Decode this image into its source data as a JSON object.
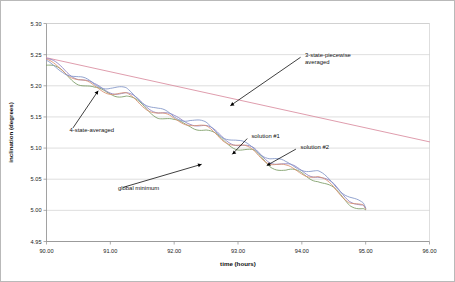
{
  "chart_data": {
    "type": "line",
    "title": "",
    "xlabel": "time (hours)",
    "ylabel": "inclination (degrees)",
    "xlim": [
      90.0,
      96.0
    ],
    "ylim": [
      4.95,
      5.3
    ],
    "xticks": [
      "90.00",
      "91.00",
      "92.00",
      "93.00",
      "94.00",
      "95.00",
      "96.00"
    ],
    "yticks": [
      "4.95",
      "5.00",
      "5.05",
      "5.10",
      "5.15",
      "5.20",
      "5.25",
      "5.30"
    ],
    "grid": "horizontal",
    "legend": "none (inline annotations)",
    "series": [
      {
        "name": "3-state-piecewise averaged",
        "color": "#d98b9e",
        "style": "straight-line",
        "x": [
          90.0,
          96.0
        ],
        "values": [
          5.245,
          5.11
        ]
      },
      {
        "name": "4-state-averaged",
        "color": "#7a9b63",
        "style": "oscillating-decay",
        "x": [
          90.0,
          90.25,
          90.5,
          90.75,
          91.0,
          91.25,
          91.5,
          91.75,
          92.0,
          92.25,
          92.5,
          92.75,
          93.0,
          93.25,
          93.5,
          93.75,
          94.0,
          94.25,
          94.5,
          94.75,
          95.0
        ],
        "values": [
          5.233,
          5.222,
          5.206,
          5.193,
          5.19,
          5.183,
          5.168,
          5.152,
          5.141,
          5.138,
          5.128,
          5.113,
          5.101,
          5.092,
          5.074,
          5.063,
          5.059,
          5.05,
          5.032,
          5.012,
          5.001
        ]
      },
      {
        "name": "solution #1",
        "color": "#8c7fc0",
        "style": "oscillating-decay",
        "x": [
          90.0,
          90.25,
          90.5,
          90.75,
          91.0,
          91.25,
          91.5,
          91.75,
          92.0,
          92.25,
          92.5,
          92.75,
          93.0,
          93.25,
          93.5,
          93.75,
          94.0,
          94.25,
          94.5,
          94.75,
          95.0
        ],
        "values": [
          5.241,
          5.229,
          5.213,
          5.199,
          5.193,
          5.186,
          5.173,
          5.159,
          5.148,
          5.143,
          5.133,
          5.119,
          5.106,
          5.096,
          5.081,
          5.071,
          5.065,
          5.055,
          5.039,
          5.019,
          5.003
        ]
      },
      {
        "name": "solution #2",
        "color": "#d98f6e",
        "style": "oscillating-decay",
        "x": [
          90.0,
          90.25,
          90.5,
          90.75,
          91.0,
          91.25,
          91.5,
          91.75,
          92.0,
          92.25,
          92.5,
          92.75,
          93.0,
          93.25,
          93.5,
          93.75,
          94.0,
          94.25,
          94.5,
          94.75,
          95.0
        ],
        "values": [
          5.238,
          5.227,
          5.21,
          5.197,
          5.191,
          5.184,
          5.17,
          5.156,
          5.145,
          5.141,
          5.131,
          5.116,
          5.104,
          5.094,
          5.078,
          5.068,
          5.062,
          5.053,
          5.036,
          5.016,
          5.002
        ]
      },
      {
        "name": "global minimum",
        "color": "#7f93c6",
        "style": "oscillating-decay",
        "x": [
          90.0,
          90.25,
          90.5,
          90.75,
          91.0,
          91.25,
          91.5,
          91.75,
          92.0,
          92.25,
          92.5,
          92.75,
          93.0,
          93.25,
          93.5,
          93.75,
          94.0,
          94.25,
          94.5,
          94.75,
          95.0
        ],
        "values": [
          5.236,
          5.226,
          5.212,
          5.202,
          5.199,
          5.192,
          5.177,
          5.161,
          5.15,
          5.147,
          5.137,
          5.122,
          5.109,
          5.1,
          5.085,
          5.074,
          5.069,
          5.06,
          5.043,
          5.023,
          5.004
        ]
      }
    ],
    "annotations": [
      {
        "id": "ann-3-state",
        "text_lines": [
          "3-state-piecewise",
          "averaged"
        ],
        "label_x": 94.05,
        "label_y": 5.246,
        "point_x": 92.88,
        "point_y": 5.168
      },
      {
        "id": "ann-4-state",
        "text_lines": [
          "4-state-averaged"
        ],
        "label_x": 90.36,
        "label_y": 5.126,
        "point_x": 90.81,
        "point_y": 5.192
      },
      {
        "id": "ann-solution-1",
        "text_lines": [
          "solution #1"
        ],
        "label_x": 93.21,
        "label_y": 5.116,
        "point_x": 92.91,
        "point_y": 5.09
      },
      {
        "id": "ann-solution-2",
        "text_lines": [
          "solution #2"
        ],
        "label_x": 93.98,
        "label_y": 5.098,
        "point_x": 93.45,
        "point_y": 5.072
      },
      {
        "id": "ann-global-minimum",
        "text_lines": [
          "global minimum"
        ],
        "label_x": 91.12,
        "label_y": 5.033,
        "point_x": 92.43,
        "point_y": 5.074
      }
    ]
  },
  "colors": {
    "background": "#ffffff",
    "frame": "#b9b9b9",
    "gridline": "#c8c8c8",
    "axis": "#8a8a8a",
    "text": "#111111"
  }
}
